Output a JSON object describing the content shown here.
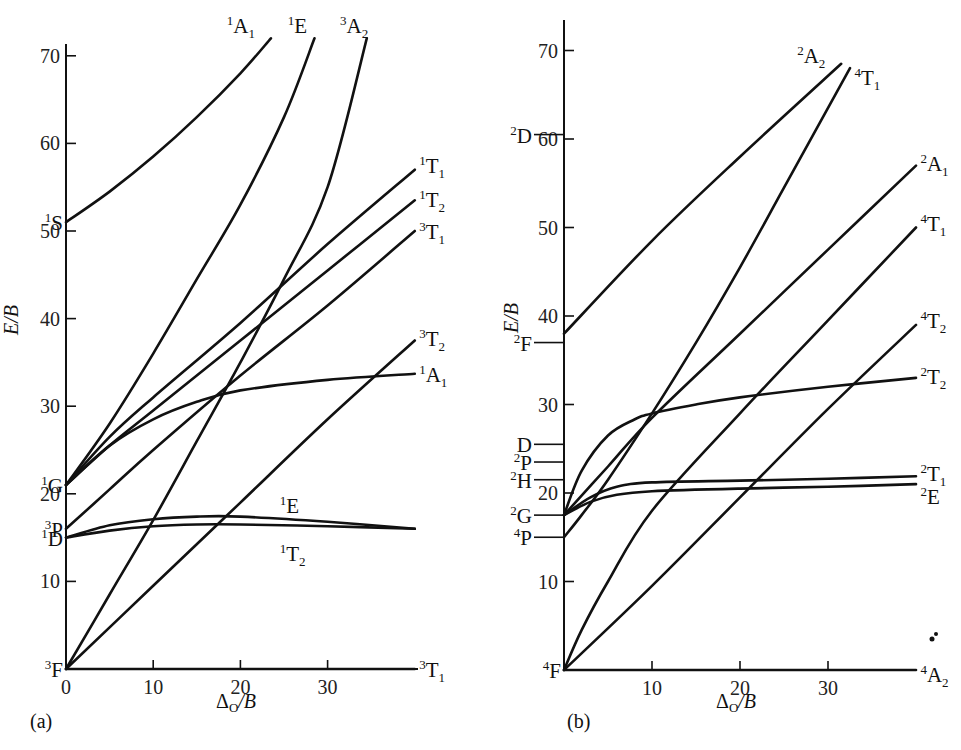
{
  "chart_data": [
    {
      "type": "line",
      "panel": "(a)",
      "title": "",
      "xlabel": "Δ_O/B",
      "ylabel": "E/B",
      "xlim": [
        0,
        40
      ],
      "ylim": [
        0,
        72
      ],
      "x_ticks": [
        0,
        10,
        20,
        30
      ],
      "y_ticks": [
        10,
        20,
        30,
        40,
        50,
        60,
        70
      ],
      "grid": false,
      "free_ion_terms": [
        {
          "label": "3F",
          "sup": "3",
          "base": "F",
          "E": 0
        },
        {
          "label": "1D",
          "sup": "1",
          "base": "D",
          "E": 15
        },
        {
          "label": "3P",
          "sup": "3",
          "base": "P",
          "E": 16
        },
        {
          "label": "1G",
          "sup": "1",
          "base": "G",
          "E": 21
        },
        {
          "label": "1S",
          "sup": "1",
          "base": "S",
          "E": 51
        }
      ],
      "series": [
        {
          "name": "1A1 (upper)",
          "sup": "1",
          "base": "A",
          "sub": "1",
          "x": [
            0,
            5,
            10,
            15,
            20,
            23.5
          ],
          "y": [
            51,
            54.5,
            58.5,
            63,
            68,
            72
          ]
        },
        {
          "name": "1E (upper)",
          "sup": "1",
          "base": "E",
          "sub": "",
          "x": [
            0,
            5,
            10,
            15,
            20,
            25,
            28.5
          ],
          "y": [
            21,
            28,
            36,
            44.5,
            53,
            63,
            72
          ]
        },
        {
          "name": "3A2",
          "sup": "3",
          "base": "A",
          "sub": "2",
          "x": [
            0,
            5,
            10,
            15,
            20,
            25,
            30,
            34.5
          ],
          "y": [
            0,
            8.5,
            17,
            26,
            35,
            44.5,
            55,
            72
          ]
        },
        {
          "name": "1T1",
          "sup": "1",
          "base": "T",
          "sub": "1",
          "x": [
            0,
            5,
            10,
            20,
            30,
            40
          ],
          "y": [
            21,
            26.5,
            31,
            39.5,
            48.5,
            57
          ]
        },
        {
          "name": "1T2 (upper)",
          "sup": "1",
          "base": "T",
          "sub": "2",
          "x": [
            0,
            5,
            10,
            20,
            30,
            40
          ],
          "y": [
            21,
            25.5,
            29.5,
            37.5,
            45.5,
            53.5
          ]
        },
        {
          "name": "3T1 (upper)",
          "sup": "3",
          "base": "T",
          "sub": "1",
          "x": [
            0,
            5,
            10,
            20,
            30,
            40
          ],
          "y": [
            16,
            20.5,
            25,
            33.5,
            41.5,
            50
          ]
        },
        {
          "name": "3T2",
          "sup": "3",
          "base": "T",
          "sub": "2",
          "x": [
            0,
            10,
            20,
            30,
            40
          ],
          "y": [
            0,
            9.5,
            19,
            28.5,
            37.5
          ]
        },
        {
          "name": "1A1 (lower)",
          "sup": "1",
          "base": "A",
          "sub": "1",
          "x": [
            0,
            5,
            10,
            15,
            20,
            30,
            40
          ],
          "y": [
            21,
            25.5,
            28.5,
            30.5,
            31.8,
            33,
            33.7
          ]
        },
        {
          "name": "1E (lower)",
          "sup": "1",
          "base": "E",
          "sub": "",
          "x": [
            0,
            5,
            10,
            15,
            20,
            30,
            40
          ],
          "y": [
            15,
            16.4,
            17.1,
            17.4,
            17.4,
            16.8,
            16
          ]
        },
        {
          "name": "1T2 (lower)",
          "sup": "1",
          "base": "T",
          "sub": "2",
          "x": [
            0,
            5,
            10,
            15,
            20,
            30,
            40
          ],
          "y": [
            15,
            15.8,
            16.3,
            16.5,
            16.5,
            16.3,
            16
          ]
        },
        {
          "name": "3T1 (ground)",
          "sup": "3",
          "base": "T",
          "sub": "1",
          "x": [
            0,
            40
          ],
          "y": [
            0,
            0
          ]
        }
      ],
      "right_labels": [
        {
          "sup": "1",
          "base": "A",
          "sub": "1",
          "x": 20.5,
          "y": 73.5,
          "anchor": "top"
        },
        {
          "sup": "1",
          "base": "E",
          "sub": "",
          "x": 27.5,
          "y": 73.5,
          "anchor": "top"
        },
        {
          "sup": "3",
          "base": "A",
          "sub": "2",
          "x": 33.5,
          "y": 73.5,
          "anchor": "top"
        },
        {
          "sup": "1",
          "base": "T",
          "sub": "1",
          "x": 40.5,
          "y": 57.5
        },
        {
          "sup": "1",
          "base": "T",
          "sub": "2",
          "x": 40.5,
          "y": 53.7
        },
        {
          "sup": "3",
          "base": "T",
          "sub": "1",
          "x": 40.5,
          "y": 50
        },
        {
          "sup": "3",
          "base": "T",
          "sub": "2",
          "x": 40.5,
          "y": 37.8
        },
        {
          "sup": "1",
          "base": "A",
          "sub": "1",
          "x": 40.5,
          "y": 33.7
        },
        {
          "sup": "1",
          "base": "E",
          "sub": "",
          "x": 24.5,
          "y": 18.7
        },
        {
          "sup": "1",
          "base": "T",
          "sub": "2",
          "x": 24.5,
          "y": 13.2
        },
        {
          "sup": "3",
          "base": "T",
          "sub": "1",
          "x": 40.5,
          "y": 0
        }
      ]
    },
    {
      "type": "line",
      "panel": "(b)",
      "title": "",
      "xlabel": "Δ_O/B",
      "ylabel": "E/B",
      "xlim": [
        0,
        40
      ],
      "ylim": [
        0,
        72
      ],
      "x_ticks": [
        10,
        20,
        30
      ],
      "y_ticks": [
        10,
        20,
        30,
        40,
        50,
        60,
        70
      ],
      "grid": false,
      "free_ion_terms": [
        {
          "label": "4F",
          "sup": "4",
          "base": "F",
          "E": 0
        },
        {
          "label": "4P",
          "sup": "4",
          "base": "P",
          "E": 15
        },
        {
          "label": "2G",
          "sup": "2",
          "base": "G",
          "E": 17.5
        },
        {
          "label": "2H",
          "sup": "2",
          "base": "H",
          "E": 21.5
        },
        {
          "label": "2P",
          "sup": "2",
          "base": "P",
          "E": 23.5
        },
        {
          "label": "D",
          "sup": "",
          "base": "D",
          "E": 25.5
        },
        {
          "label": "2F",
          "sup": "2",
          "base": "F",
          "E": 37
        },
        {
          "label": "2D",
          "sup": "2",
          "base": "D",
          "E": 60.5
        }
      ],
      "series": [
        {
          "name": "2A2",
          "sup": "2",
          "base": "A",
          "sub": "2",
          "x": [
            0,
            10,
            20,
            31.5
          ],
          "y": [
            38,
            48.5,
            58,
            68.5
          ]
        },
        {
          "name": "4T1 (upper)",
          "sup": "4",
          "base": "T",
          "sub": "1",
          "x": [
            0,
            2,
            5,
            10,
            15,
            20,
            25,
            32.5
          ],
          "y": [
            15,
            17.5,
            21.5,
            29,
            37,
            45.5,
            54.5,
            68
          ]
        },
        {
          "name": "2A1",
          "sup": "2",
          "base": "A",
          "sub": "1",
          "x": [
            0,
            5,
            10,
            20,
            30,
            40
          ],
          "y": [
            17.5,
            23,
            28.5,
            38,
            47.5,
            57
          ]
        },
        {
          "name": "4T1 (lower)",
          "sup": "4",
          "base": "T",
          "sub": "1",
          "x": [
            0,
            2,
            5,
            10,
            20,
            30,
            40
          ],
          "y": [
            0,
            4.5,
            10,
            18,
            29,
            39.5,
            50
          ]
        },
        {
          "name": "4T2",
          "sup": "4",
          "base": "T",
          "sub": "2",
          "x": [
            0,
            10,
            20,
            30,
            40
          ],
          "y": [
            0,
            9.5,
            19.5,
            29.5,
            39
          ]
        },
        {
          "name": "2T2",
          "sup": "2",
          "base": "T",
          "sub": "2",
          "x": [
            0,
            2,
            5,
            8,
            10,
            15,
            20,
            30,
            40
          ],
          "y": [
            17.5,
            22.5,
            26.5,
            28.3,
            29,
            30,
            30.8,
            32,
            33
          ]
        },
        {
          "name": "2T1",
          "sup": "2",
          "base": "T",
          "sub": "1",
          "x": [
            0,
            3,
            6,
            10,
            20,
            30,
            40
          ],
          "y": [
            17.5,
            19.5,
            20.7,
            21.2,
            21.4,
            21.6,
            21.9
          ]
        },
        {
          "name": "2E",
          "sup": "2",
          "base": "E",
          "sub": "",
          "x": [
            0,
            3,
            6,
            10,
            20,
            30,
            40
          ],
          "y": [
            17.5,
            19,
            19.8,
            20.2,
            20.5,
            20.7,
            21
          ]
        },
        {
          "name": "4A2",
          "sup": "4",
          "base": "A",
          "sub": "2",
          "x": [
            0,
            40
          ],
          "y": [
            0,
            0
          ]
        }
      ],
      "right_labels": [
        {
          "sup": "2",
          "base": "A",
          "sub": "2",
          "x": 26.5,
          "y": 69.5
        },
        {
          "sup": "4",
          "base": "T",
          "sub": "1",
          "x": 33,
          "y": 67
        },
        {
          "sup": "2",
          "base": "A",
          "sub": "1",
          "x": 40.5,
          "y": 57.3
        },
        {
          "sup": "4",
          "base": "T",
          "sub": "1",
          "x": 40.5,
          "y": 50.5
        },
        {
          "sup": "4",
          "base": "T",
          "sub": "2",
          "x": 40.5,
          "y": 39.5
        },
        {
          "sup": "2",
          "base": "T",
          "sub": "2",
          "x": 40.5,
          "y": 33.2
        },
        {
          "sup": "2",
          "base": "T",
          "sub": "1",
          "x": 40.5,
          "y": 22.3
        },
        {
          "sup": "2",
          "base": "E",
          "sub": "",
          "x": 40.5,
          "y": 19.7
        },
        {
          "sup": "4",
          "base": "A",
          "sub": "2",
          "x": 40.5,
          "y": -0.5
        }
      ]
    }
  ],
  "panels": {
    "a": {
      "label": "(a)",
      "xlabel_main": "Δ",
      "xlabel_sub": "O",
      "xlabel_tail": "/B",
      "ylabel": "E/B"
    },
    "b": {
      "label": "(b)",
      "xlabel_main": "Δ",
      "xlabel_sub": "O",
      "xlabel_tail": "/B",
      "ylabel": "E/B"
    }
  }
}
